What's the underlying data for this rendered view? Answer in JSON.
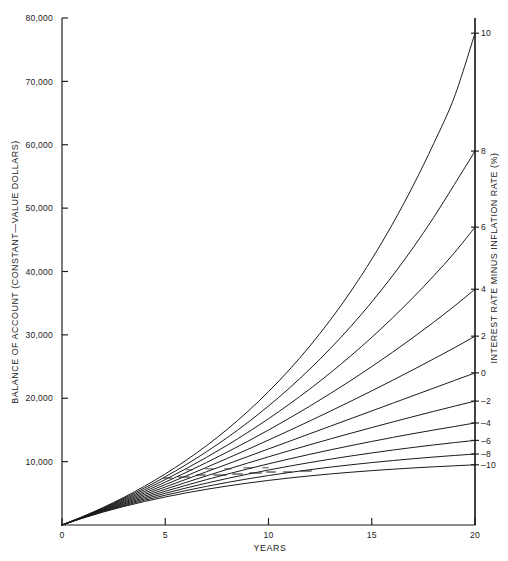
{
  "figure": {
    "background": "#ffffff",
    "ink_color": "#1b1b1b"
  },
  "axes": {
    "left_title": "BALANCE OF ACCOUNT (CONSTANT—VALUE DOLLARS)",
    "right_title": "INTEREST RATE MINUS INFLATION RATE (%)",
    "bottom_title": "YEARS",
    "y_ticks": [
      "80,000",
      "70,000",
      "60,000",
      "50,000",
      "40,000",
      "30,000",
      "20,000",
      "10,000"
    ],
    "x_ticks": [
      "0",
      "5",
      "10",
      "15",
      "20"
    ],
    "right_ticks": [
      "10",
      "8",
      "6",
      "4",
      "2",
      "0",
      "–2",
      "–4",
      "–6",
      "–8",
      "–10"
    ]
  },
  "chart_data": {
    "type": "line",
    "title": "",
    "xlabel": "YEARS",
    "ylabel": "BALANCE OF ACCOUNT (CONSTANT—VALUE DOLLARS)",
    "y2label": "INTEREST RATE MINUS INFLATION RATE (%)",
    "xlim": [
      0,
      20
    ],
    "ylim": [
      0,
      80000
    ],
    "grid": false,
    "legend_position": "right-axis-labels",
    "x": [
      0,
      1,
      2,
      3,
      4,
      5,
      6,
      7,
      8,
      9,
      10,
      11,
      12,
      13,
      14,
      15,
      16,
      17,
      18,
      19,
      20
    ],
    "series": [
      {
        "name": "10",
        "rate_pct": 10,
        "values": [
          0,
          1320,
          2772,
          4369,
          6126,
          8059,
          10185,
          12523,
          15096,
          17925,
          21038,
          24462,
          28228,
          32371,
          36928,
          41941,
          47455,
          53521,
          60193,
          67532,
          77600
        ]
      },
      {
        "name": "8",
        "rate_pct": 8,
        "values": [
          0,
          1296,
          2696,
          4207,
          5840,
          7603,
          9507,
          11564,
          13785,
          16184,
          18774,
          21572,
          24594,
          27857,
          31382,
          35189,
          39300,
          43740,
          48535,
          53714,
          59000
        ]
      },
      {
        "name": "6",
        "rate_pct": 6,
        "values": [
          0,
          1272,
          2620,
          4050,
          5565,
          7171,
          8873,
          10678,
          12590,
          14618,
          16767,
          19045,
          21460,
          24020,
          26733,
          29609,
          32658,
          35889,
          39315,
          42945,
          47000
        ]
      },
      {
        "name": "4",
        "rate_pct": 4,
        "values": [
          0,
          1248,
          2546,
          3896,
          5300,
          6760,
          8278,
          9858,
          11500,
          13208,
          14985,
          16832,
          18754,
          20752,
          22830,
          24991,
          27239,
          29576,
          32007,
          34535,
          37200
        ]
      },
      {
        "name": "2",
        "rate_pct": 2,
        "values": [
          0,
          1224,
          2472,
          3746,
          5045,
          6370,
          7721,
          9100,
          10506,
          11940,
          13403,
          14895,
          16417,
          17969,
          19553,
          21168,
          22815,
          24496,
          26210,
          27958,
          29800
        ]
      },
      {
        "name": "0",
        "rate_pct": 0,
        "values": [
          0,
          1200,
          2400,
          3600,
          4800,
          6000,
          7200,
          8400,
          9600,
          10800,
          12000,
          13200,
          14400,
          15600,
          16800,
          18000,
          19200,
          20400,
          21600,
          22800,
          24000
        ]
      },
      {
        "name": "–2",
        "rate_pct": -2,
        "values": [
          0,
          1176,
          2329,
          3458,
          4565,
          5650,
          6713,
          7755,
          8776,
          9777,
          10758,
          11719,
          12661,
          13584,
          14489,
          15375,
          16244,
          17095,
          17929,
          18747,
          19550
        ]
      },
      {
        "name": "–4",
        "rate_pct": -4,
        "values": [
          0,
          1152,
          2258,
          3320,
          4339,
          5317,
          6256,
          7158,
          8023,
          8854,
          9652,
          10418,
          11153,
          11859,
          12536,
          13187,
          13811,
          14411,
          14987,
          15540,
          16100
        ]
      },
      {
        "name": "–6",
        "rate_pct": -6,
        "values": [
          0,
          1128,
          2188,
          3185,
          4122,
          5003,
          5831,
          6609,
          7340,
          8028,
          8674,
          9282,
          9853,
          10390,
          10895,
          11370,
          11816,
          12236,
          12630,
          13000,
          13350
        ]
      },
      {
        "name": "–8",
        "rate_pct": -8,
        "values": [
          0,
          1104,
          2120,
          3054,
          3913,
          4704,
          5431,
          6100,
          6716,
          7283,
          7804,
          8284,
          8725,
          9131,
          9504,
          9848,
          10164,
          10455,
          10723,
          10969,
          11200
        ]
      },
      {
        "name": "–10",
        "rate_pct": -10,
        "values": [
          0,
          1080,
          2052,
          2927,
          3714,
          4423,
          5060,
          5634,
          6151,
          6616,
          7034,
          7411,
          7750,
          8055,
          8329,
          8577,
          8799,
          9000,
          9180,
          9342,
          9500
        ]
      }
    ]
  }
}
